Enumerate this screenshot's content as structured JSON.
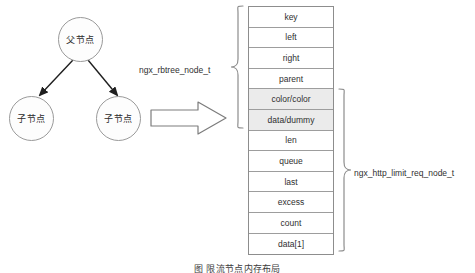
{
  "diagram": {
    "tree": {
      "parent_node_label": "父节点",
      "child_left_label": "子节点",
      "child_right_label": "子节点"
    },
    "transform_arrow": "block-arrow-right",
    "struct_table": {
      "rows": [
        {
          "label": "key",
          "shaded": false
        },
        {
          "label": "left",
          "shaded": false
        },
        {
          "label": "right",
          "shaded": false
        },
        {
          "label": "parent",
          "shaded": false
        },
        {
          "label": "color/color",
          "shaded": true
        },
        {
          "label": "data/dummy",
          "shaded": true
        },
        {
          "label": "len",
          "shaded": false
        },
        {
          "label": "queue",
          "shaded": false
        },
        {
          "label": "last",
          "shaded": false
        },
        {
          "label": "excess",
          "shaded": false
        },
        {
          "label": "count",
          "shaded": false
        },
        {
          "label": "data[1]",
          "shaded": false
        }
      ]
    },
    "annotations": {
      "left_brace_label": "ngx_rbtree_node_t",
      "right_brace_label": "ngx_http_limit_req_node_t"
    },
    "caption": "图 限流节点内存布局",
    "colors": {
      "line": "#8d8d8d",
      "shaded_row": "#ebebeb",
      "text": "#2f2f2f",
      "background": "#ffffff"
    }
  }
}
